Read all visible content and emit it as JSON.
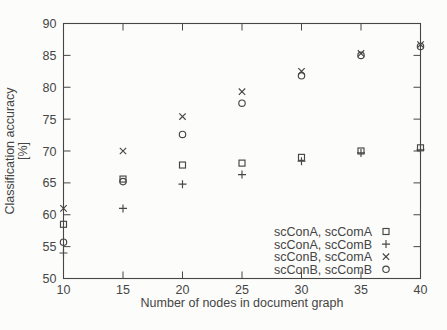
{
  "figure": {
    "background": "#fcfcfa",
    "ink": "#464646"
  },
  "chart_data": {
    "type": "scatter",
    "title": "",
    "xlabel": "Number of nodes in document graph",
    "ylabel": "Classification accuracy [%]",
    "ylabel_line1": "Classification accuracy",
    "ylabel_line2": "[%]",
    "xlim": [
      10,
      40
    ],
    "ylim": [
      50,
      90
    ],
    "xticks": [
      10,
      15,
      20,
      25,
      30,
      35,
      40
    ],
    "yticks": [
      50,
      55,
      60,
      65,
      70,
      75,
      80,
      85,
      90
    ],
    "grid": false,
    "legend_position": "inside-bottom-right",
    "x": [
      10,
      15,
      20,
      25,
      30,
      35,
      40
    ],
    "series": [
      {
        "name": "scConA, scComA",
        "marker": "square",
        "values": [
          58.5,
          65.6,
          67.8,
          68.1,
          69.0,
          70.0,
          70.5
        ]
      },
      {
        "name": "scConA, scComB",
        "marker": "plus",
        "values": [
          54.0,
          61.0,
          64.8,
          66.3,
          68.4,
          69.7,
          70.2
        ]
      },
      {
        "name": "scConB, scComA",
        "marker": "cross",
        "values": [
          61.0,
          70.0,
          75.4,
          79.3,
          82.5,
          85.3,
          86.7
        ]
      },
      {
        "name": "scConB, scComB",
        "marker": "circle",
        "values": [
          55.7,
          65.2,
          72.6,
          77.5,
          81.8,
          85.0,
          86.4
        ]
      }
    ]
  }
}
